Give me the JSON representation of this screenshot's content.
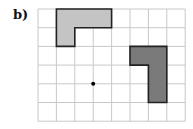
{
  "label": "b)",
  "grid": {
    "cols": 8,
    "rows": 6,
    "origin_x": 38,
    "origin_y": 9,
    "cell_w": 18.4,
    "cell_h": 18.7,
    "line_color": "#c8c8c8"
  },
  "shapes": [
    {
      "name": "light-l-shape",
      "fill": "#c4c4c4",
      "stroke": "#222222",
      "points_grid": [
        [
          1,
          0
        ],
        [
          4,
          0
        ],
        [
          4,
          1
        ],
        [
          2,
          1
        ],
        [
          2,
          2
        ],
        [
          1,
          2
        ]
      ]
    },
    {
      "name": "dark-l-shape",
      "fill": "#7a7a7a",
      "stroke": "#222222",
      "points_grid": [
        [
          5,
          2
        ],
        [
          7,
          2
        ],
        [
          7,
          5
        ],
        [
          6,
          5
        ],
        [
          6,
          3
        ],
        [
          5,
          3
        ]
      ]
    }
  ],
  "center_point": {
    "grid_x": 3,
    "grid_y": 4,
    "color": "#000000"
  }
}
